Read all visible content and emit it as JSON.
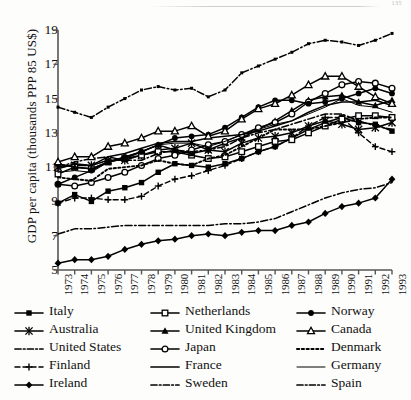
{
  "page": {
    "running_head": "135"
  },
  "chart_data": {
    "type": "line",
    "title": "",
    "xlabel": "",
    "ylabel": "GDP per capita (thousands PPP 85 US$)",
    "x": [
      1973,
      1974,
      1975,
      1976,
      1977,
      1978,
      1979,
      1980,
      1981,
      1982,
      1983,
      1984,
      1985,
      1986,
      1987,
      1988,
      1989,
      1990,
      1991,
      1992,
      1993
    ],
    "xlim": [
      1973,
      1993
    ],
    "ylim": [
      5,
      19
    ],
    "yticks": [
      5,
      7,
      9,
      11,
      13,
      15,
      17,
      19
    ],
    "xticks": [
      "1973",
      "1974",
      "1975",
      "1976",
      "1977",
      "1978",
      "1979",
      "1980",
      "1981",
      "1982",
      "1983",
      "1984",
      "1985",
      "1986",
      "1987",
      "1988",
      "1989",
      "1990",
      "1991",
      "1992",
      "1993"
    ],
    "grid": false,
    "legend_position": "below",
    "legend_columns": 3,
    "series": [
      {
        "name": "Italy",
        "marker": "filled-square",
        "line": "solid",
        "values": [
          8.9,
          9.4,
          9.0,
          9.6,
          9.8,
          10.1,
          10.7,
          11.2,
          11.1,
          11.0,
          11.2,
          11.5,
          11.9,
          12.2,
          12.7,
          13.2,
          13.6,
          13.9,
          13.6,
          13.5,
          13.1
        ]
      },
      {
        "name": "Australia",
        "marker": "star",
        "line": "solid",
        "values": [
          11.0,
          11.1,
          11.1,
          11.4,
          11.4,
          11.7,
          12.0,
          12.1,
          12.4,
          12.0,
          11.9,
          12.4,
          12.7,
          12.8,
          13.0,
          13.4,
          13.7,
          13.5,
          13.2,
          13.3,
          13.6
        ]
      },
      {
        "name": "United States",
        "marker": "small-dot",
        "line": "dash-dot",
        "values": [
          14.5,
          14.2,
          13.9,
          14.5,
          15.0,
          15.5,
          15.7,
          15.5,
          15.6,
          15.1,
          15.5,
          16.5,
          16.9,
          17.3,
          17.7,
          18.2,
          18.4,
          18.3,
          18.1,
          18.4,
          18.8
        ]
      },
      {
        "name": "Finland",
        "marker": "plus",
        "line": "dash-plus",
        "values": [
          8.9,
          9.2,
          9.2,
          9.1,
          9.1,
          9.3,
          9.9,
          10.3,
          10.5,
          10.8,
          11.1,
          11.5,
          11.9,
          12.2,
          12.7,
          13.4,
          13.9,
          13.9,
          13.0,
          12.2,
          11.9
        ]
      },
      {
        "name": "Ireland",
        "marker": "filled-diamond",
        "line": "solid",
        "values": [
          5.4,
          5.6,
          5.6,
          5.8,
          6.2,
          6.5,
          6.7,
          6.8,
          7.0,
          7.1,
          7.0,
          7.2,
          7.3,
          7.3,
          7.6,
          7.8,
          8.3,
          8.7,
          8.9,
          9.2,
          10.3
        ]
      },
      {
        "name": "Netherlands",
        "marker": "open-square",
        "line": "solid",
        "values": [
          10.6,
          11.0,
          10.9,
          11.3,
          11.5,
          11.7,
          11.9,
          11.9,
          11.7,
          11.5,
          11.6,
          11.9,
          12.2,
          12.5,
          12.6,
          13.0,
          13.4,
          13.8,
          14.0,
          14.0,
          13.9
        ]
      },
      {
        "name": "United Kingdom",
        "marker": "filled-triangle",
        "line": "solid",
        "values": [
          11.2,
          11.0,
          10.9,
          11.3,
          11.5,
          11.9,
          12.3,
          12.0,
          11.8,
          12.0,
          12.4,
          12.7,
          13.2,
          13.7,
          14.3,
          14.9,
          15.1,
          15.2,
          14.8,
          14.6,
          14.9
        ]
      },
      {
        "name": "Japan",
        "marker": "open-circle",
        "line": "solid",
        "values": [
          10.0,
          9.9,
          10.1,
          10.4,
          10.7,
          11.1,
          11.5,
          11.7,
          12.0,
          12.3,
          12.5,
          12.9,
          13.3,
          13.6,
          14.1,
          14.8,
          15.3,
          15.8,
          16.0,
          15.9,
          15.6
        ]
      },
      {
        "name": "France",
        "marker": "none",
        "line": "solid",
        "values": [
          10.9,
          11.2,
          11.1,
          11.6,
          11.8,
          12.1,
          12.4,
          12.5,
          12.5,
          12.7,
          12.8,
          12.9,
          13.1,
          13.4,
          13.7,
          14.2,
          14.6,
          14.8,
          14.8,
          14.9,
          14.6
        ]
      },
      {
        "name": "Sweden",
        "marker": "none",
        "line": "dash-dot",
        "values": [
          11.0,
          11.3,
          11.5,
          11.6,
          11.4,
          11.4,
          11.8,
          12.0,
          11.9,
          12.0,
          12.2,
          12.7,
          13.0,
          13.2,
          13.5,
          13.8,
          14.1,
          14.1,
          13.7,
          13.4,
          13.2
        ]
      },
      {
        "name": "Norway",
        "marker": "filled-circle",
        "line": "solid",
        "values": [
          10.0,
          10.4,
          10.8,
          11.3,
          11.6,
          11.9,
          12.3,
          12.7,
          12.8,
          12.9,
          13.3,
          13.9,
          14.5,
          14.9,
          14.9,
          14.7,
          14.8,
          15.0,
          15.3,
          15.6,
          15.3
        ]
      },
      {
        "name": "Canada",
        "marker": "open-triangle",
        "line": "solid",
        "values": [
          11.3,
          11.6,
          11.6,
          12.2,
          12.4,
          12.7,
          13.1,
          13.1,
          13.4,
          12.8,
          13.1,
          13.8,
          14.4,
          14.7,
          15.2,
          15.8,
          16.3,
          16.3,
          15.7,
          15.1,
          14.7
        ]
      },
      {
        "name": "Denmark",
        "marker": "none",
        "line": "dotted",
        "values": [
          10.4,
          10.3,
          10.2,
          10.9,
          11.0,
          11.1,
          11.4,
          11.2,
          11.1,
          11.5,
          11.7,
          12.2,
          12.7,
          13.2,
          13.2,
          13.2,
          13.4,
          13.6,
          13.8,
          13.9,
          13.9
        ]
      },
      {
        "name": "Germany",
        "marker": "none",
        "line": "thin-solid",
        "values": [
          10.7,
          10.8,
          10.7,
          11.3,
          11.6,
          11.9,
          12.3,
          12.4,
          12.4,
          12.2,
          12.5,
          12.9,
          13.2,
          13.5,
          13.7,
          14.1,
          14.5,
          15.0,
          14.6,
          14.5,
          14.2
        ]
      },
      {
        "name": "Spain",
        "marker": "none",
        "line": "dash-dot",
        "values": [
          7.1,
          7.4,
          7.4,
          7.5,
          7.6,
          7.6,
          7.6,
          7.6,
          7.6,
          7.6,
          7.7,
          7.7,
          7.8,
          8.0,
          8.4,
          8.8,
          9.2,
          9.5,
          9.7,
          9.8,
          10.1
        ]
      }
    ]
  },
  "legend": {
    "columns": [
      {
        "items": [
          {
            "label": "Italy",
            "key": "filled-square-solid"
          },
          {
            "label": "Australia",
            "key": "star-solid"
          },
          {
            "label": "United States",
            "key": "dash-dot-plain"
          },
          {
            "label": "Finland",
            "key": "plus-dash"
          },
          {
            "label": "Ireland",
            "key": "filled-diamond-solid"
          }
        ]
      },
      {
        "items": [
          {
            "label": "Netherlands",
            "key": "open-square-solid"
          },
          {
            "label": "United Kingdom",
            "key": "filled-triangle-solid"
          },
          {
            "label": "Japan",
            "key": "open-circle-solid"
          },
          {
            "label": "France",
            "key": "plain-solid"
          },
          {
            "label": "Sweden",
            "key": "dash-dot-plain"
          }
        ]
      },
      {
        "items": [
          {
            "label": "Norway",
            "key": "filled-circle-solid"
          },
          {
            "label": "Canada",
            "key": "open-triangle-solid"
          },
          {
            "label": "Denmark",
            "key": "dotted-plain"
          },
          {
            "label": "Germany",
            "key": "thin-solid-plain"
          },
          {
            "label": "Spain",
            "key": "dash-dot-plain"
          }
        ]
      }
    ]
  }
}
